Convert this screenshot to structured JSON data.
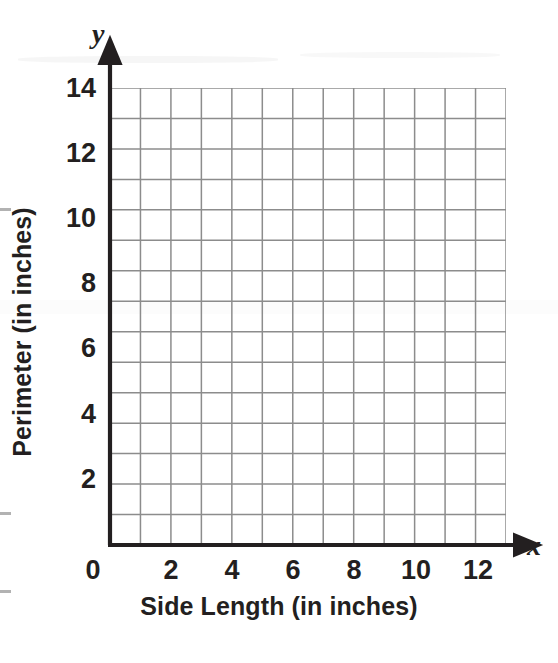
{
  "chart_data": {
    "type": "scatter",
    "title": "",
    "subtitle": "",
    "xlabel": "Side Length (in inches)",
    "ylabel": "Perimeter (in inches)",
    "x_axis_variable": "x",
    "y_axis_variable": "y",
    "xlim": [
      0,
      13
    ],
    "ylim": [
      0,
      15
    ],
    "x_ticks": [
      0,
      2,
      4,
      6,
      8,
      10,
      12
    ],
    "x_tick_labels": [
      "0",
      "2",
      "4",
      "6",
      "8",
      "10",
      "12"
    ],
    "y_ticks": [
      2,
      4,
      6,
      8,
      10,
      12,
      14
    ],
    "y_tick_labels": [
      "2",
      "4",
      "6",
      "8",
      "10",
      "12",
      "14"
    ],
    "x_minor_step": 1,
    "y_minor_step": 1,
    "grid": true,
    "grid_columns": 13,
    "grid_rows": 15,
    "legend": null,
    "series": [],
    "values": [],
    "annotations": [],
    "colors": {
      "grid_line": "#8c8c8c",
      "axis_line": "#231f20",
      "text": "#231f20",
      "background": "#ffffff"
    }
  },
  "axis": {
    "x_variable": "x",
    "y_variable": "y",
    "x_title": "Side Length (in inches)",
    "y_title": "Perimeter (in inches)"
  },
  "ticks": {
    "x": [
      "0",
      "2",
      "4",
      "6",
      "8",
      "10",
      "12"
    ],
    "y": [
      "14",
      "12",
      "10",
      "8",
      "6",
      "4",
      "2"
    ]
  }
}
